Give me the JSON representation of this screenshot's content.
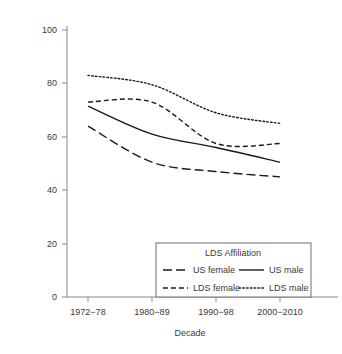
{
  "chart_data": {
    "type": "line",
    "title": "",
    "xlabel": "Decade",
    "ylabel": "",
    "categories": [
      "1972−78",
      "1980−89",
      "1990−98",
      "2000−2010"
    ],
    "ylim": [
      0,
      100
    ],
    "yticks": [
      0,
      20,
      40,
      60,
      80,
      100
    ],
    "ytick_labels": [
      "0",
      "20",
      "40",
      "60",
      "80",
      "100"
    ],
    "grid": false,
    "legend_position": "lower-right-inside",
    "legend_title": "LDS Affiliation",
    "series": [
      {
        "name": "US female",
        "style": "long-dash",
        "values": [
          64,
          50.5,
          47,
          45
        ]
      },
      {
        "name": "US male",
        "style": "solid",
        "values": [
          71.5,
          61,
          56,
          50.5
        ]
      },
      {
        "name": "LDS female",
        "style": "dash",
        "values": [
          73,
          73,
          57.5,
          57.5
        ]
      },
      {
        "name": "LDS male",
        "style": "dotted",
        "values": [
          83,
          79.5,
          69,
          65
        ]
      }
    ]
  },
  "axes": {
    "y_tick_0": "0",
    "y_tick_20": "20",
    "y_tick_40": "40",
    "y_tick_60": "60",
    "y_tick_80": "80",
    "y_tick_100": "100",
    "x_tick_0": "1972−78",
    "x_tick_1": "1980−89",
    "x_tick_2": "1990−98",
    "x_tick_3": "2000−2010",
    "x_axis_title": "Decade"
  },
  "legend": {
    "title": "LDS Affiliation",
    "entries": [
      {
        "label": "US female",
        "style": "long-dash"
      },
      {
        "label": "US male",
        "style": "solid"
      },
      {
        "label": "LDS female",
        "style": "dash"
      },
      {
        "label": "LDS male",
        "style": "dotted"
      }
    ]
  },
  "colors": {
    "line": "#1a1a1a",
    "axis": "#8a8a8a",
    "text": "#3a3a3a",
    "background": "#ffffff"
  }
}
